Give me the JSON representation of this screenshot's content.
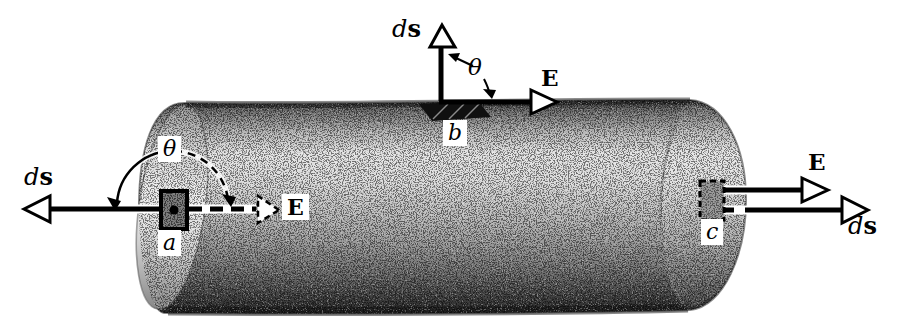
{
  "figure": {
    "type": "physics-diagram",
    "background": "#ffffff",
    "ink": "#000000",
    "shading": {
      "light": "#e7e7e7",
      "mid": "#b9b9b9",
      "dark": "#3a3a3a"
    }
  },
  "labels": {
    "d": "d",
    "s": "s",
    "E": "E",
    "theta": "θ",
    "points": {
      "a": "a",
      "b": "b",
      "c": "c"
    }
  }
}
